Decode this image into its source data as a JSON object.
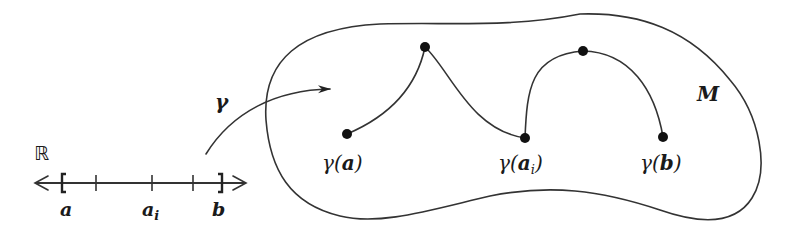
{
  "diagram": {
    "colors": {
      "ink": "#333333",
      "dot": "#111111",
      "background": "#ffffff"
    },
    "real_line": {
      "symbol": "ℝ",
      "interval_start_label": "a",
      "interval_mid_label": "a",
      "interval_mid_subscript": "i",
      "interval_end_label": "b",
      "left_bracket": "[",
      "right_bracket": "]",
      "tick_count": 3
    },
    "map": {
      "label": "γ"
    },
    "manifold": {
      "label": "M",
      "points": [
        {
          "label": "γ(a)",
          "text": "γ(",
          "arg": "a",
          "sub": "",
          "close": ")"
        },
        {
          "label": "γ(a_i)",
          "text": "γ(",
          "arg": "a",
          "sub": "i",
          "close": ")"
        },
        {
          "label": "γ(b)",
          "text": "γ(",
          "arg": "b",
          "sub": "",
          "close": ")"
        }
      ],
      "intermediate_points": 2
    }
  }
}
